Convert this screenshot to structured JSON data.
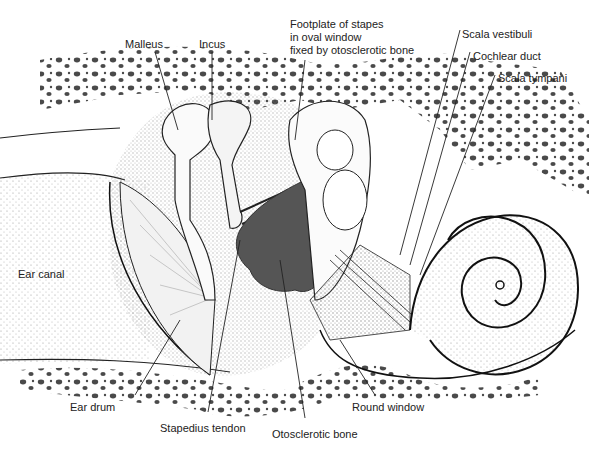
{
  "diagram": {
    "labels": {
      "malleus": "Malleus",
      "incus": "Incus",
      "footplate": "Footplate of stapes\nin oval window\nfixed by otosclerotic bone",
      "scala_vestibuli": "Scala vestibuli",
      "cochlear_duct": "Cochlear duct",
      "scala_tympani": "Scala tympani",
      "ear_canal": "Ear canal",
      "ear_drum": "Ear drum",
      "stapedius_tendon": "Stapedius tendon",
      "otosclerotic_bone": "Otosclerotic bone",
      "round_window": "Round window"
    },
    "colors": {
      "ink": "#1a1a1a",
      "otosclerotic_fill": "#555555",
      "stipple": "#cfcfcf",
      "bone_hole": "#2a2a2a"
    }
  }
}
